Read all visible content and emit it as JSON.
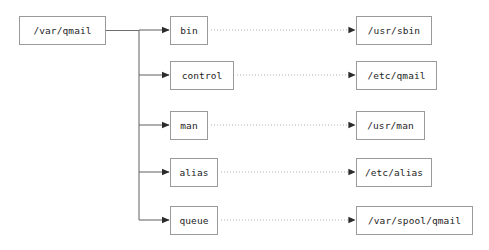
{
  "diagram": {
    "type": "tree-mapping-diagram",
    "root": {
      "id": "var-qmail",
      "label": "/var/qmail",
      "x": 19,
      "y": 16,
      "w": 87,
      "h": 29
    },
    "trunk": {
      "x": 139,
      "y_top": 30,
      "y_bottom": 220
    },
    "colors": {
      "box_border": "#9a9a9a",
      "box_fill": "#ffffff",
      "text": "#1d1d1d",
      "solid_edge": "#6e6e6e",
      "dotted_edge": "#b0b0b0",
      "arrowhead": "#2b2b2b",
      "background": "#ffffff"
    },
    "rows": [
      {
        "id": "bin",
        "source": {
          "label": "bin",
          "x": 170,
          "y": 16,
          "w": 38,
          "h": 29
        },
        "target": {
          "label": "/usr/sbin",
          "x": 356,
          "y": 16,
          "w": 76,
          "h": 29
        },
        "center_y": 30
      },
      {
        "id": "control",
        "source": {
          "label": "control",
          "x": 170,
          "y": 61,
          "w": 64,
          "h": 29
        },
        "target": {
          "label": "/etc/qmail",
          "x": 356,
          "y": 61,
          "w": 81,
          "h": 29
        },
        "center_y": 75
      },
      {
        "id": "man",
        "source": {
          "label": "man",
          "x": 170,
          "y": 111,
          "w": 38,
          "h": 29
        },
        "target": {
          "label": "/usr/man",
          "x": 356,
          "y": 111,
          "w": 69,
          "h": 29
        },
        "center_y": 125
      },
      {
        "id": "alias",
        "source": {
          "label": "alias",
          "x": 170,
          "y": 158,
          "w": 48,
          "h": 29
        },
        "target": {
          "label": "/etc/alias",
          "x": 356,
          "y": 158,
          "w": 76,
          "h": 29
        },
        "center_y": 172
      },
      {
        "id": "queue",
        "source": {
          "label": "queue",
          "x": 170,
          "y": 206,
          "w": 48,
          "h": 29
        },
        "target": {
          "label": "/var/spool/qmail",
          "x": 356,
          "y": 206,
          "w": 117,
          "h": 29
        },
        "center_y": 220
      }
    ]
  }
}
